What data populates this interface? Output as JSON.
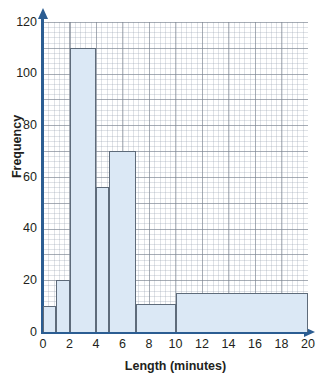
{
  "figure": {
    "title_remnant": "",
    "colors": {
      "bar_fill": "#dbe8f5",
      "bar_border": "#5e6b7a",
      "axis": "#2b5d92",
      "grid_major": "#78808c",
      "grid_minor": "#96a0af",
      "text": "#231f20",
      "background": "#ffffff"
    }
  },
  "chart_data": {
    "type": "bar",
    "title": "",
    "xlabel": "Length (minutes)",
    "ylabel": "Frequency",
    "xlim": [
      0,
      20
    ],
    "ylim": [
      0,
      120
    ],
    "grid": true,
    "legend": "none",
    "x_ticks": [
      "0",
      "2",
      "4",
      "6",
      "8",
      "10",
      "12",
      "14",
      "16",
      "18",
      "20"
    ],
    "x_tick_values": [
      0,
      2,
      4,
      6,
      8,
      10,
      12,
      14,
      16,
      18,
      20
    ],
    "y_ticks": [
      "0",
      "20",
      "40",
      "60",
      "80",
      "100",
      "120"
    ],
    "y_tick_values": [
      0,
      20,
      40,
      60,
      80,
      100,
      120
    ],
    "bins": [
      {
        "label": "0-1",
        "start": 0,
        "end": 1,
        "frequency": 10
      },
      {
        "label": "1-2",
        "start": 1,
        "end": 2,
        "frequency": 20
      },
      {
        "label": "2-4",
        "start": 2,
        "end": 4,
        "frequency": 110
      },
      {
        "label": "4-5",
        "start": 4,
        "end": 5,
        "frequency": 56
      },
      {
        "label": "5-7",
        "start": 5,
        "end": 7,
        "frequency": 70
      },
      {
        "label": "7-10",
        "start": 7,
        "end": 10,
        "frequency": 11
      },
      {
        "label": "10-20",
        "start": 10,
        "end": 20,
        "frequency": 15
      }
    ],
    "categories": [
      "0-1",
      "1-2",
      "2-4",
      "4-5",
      "5-7",
      "7-10",
      "10-20"
    ],
    "values": [
      10,
      20,
      110,
      56,
      70,
      11,
      15
    ]
  }
}
